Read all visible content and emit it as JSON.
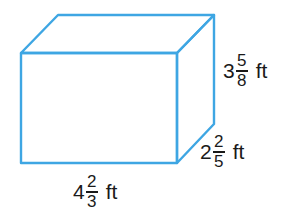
{
  "diagram": {
    "type": "rectangular-prism",
    "stroke_color": "#3ea6e3",
    "fill_color": "#ffffff",
    "vertices": {
      "front_top_left": [
        21,
        53
      ],
      "front_top_right": [
        177,
        53
      ],
      "front_bottom_left": [
        21,
        163
      ],
      "front_bottom_right": [
        177,
        163
      ],
      "back_top_left": [
        58,
        15
      ],
      "back_top_right": [
        214,
        15
      ],
      "back_bottom_right": [
        214,
        124
      ]
    },
    "dimensions": {
      "length": {
        "whole": "4",
        "numerator": "2",
        "denominator": "3",
        "unit": "ft"
      },
      "width": {
        "whole": "2",
        "numerator": "2",
        "denominator": "5",
        "unit": "ft"
      },
      "height": {
        "whole": "3",
        "numerator": "5",
        "denominator": "8",
        "unit": "ft"
      }
    }
  }
}
